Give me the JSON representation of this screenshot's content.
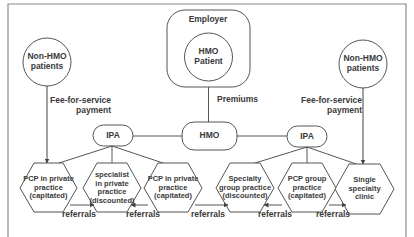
{
  "nodes": {
    "employer": {
      "label": "Employer"
    },
    "hmo_patient": {
      "label": "HMO\nPatient"
    },
    "non_hmo_left": {
      "label": "Non-HMO\npatients"
    },
    "non_hmo_right": {
      "label": "Non-HMO\npatients"
    },
    "ipa_left": {
      "label": "IPA"
    },
    "hmo": {
      "label": "HMO"
    },
    "ipa_right": {
      "label": "IPA"
    },
    "hex": [
      {
        "label": "PCP in private\npractice\n(capitated)"
      },
      {
        "label": "specialist\nin private\npractice\n(discounted)"
      },
      {
        "label": "PCP in private\npractice\n(capitated)"
      },
      {
        "label": "Specialty\ngroup practice\n(discounted)"
      },
      {
        "label": "PCP group\npractice\n(capitated)"
      },
      {
        "label": "Single\nspecialty\nclinic"
      }
    ]
  },
  "edge_labels": {
    "fee_left": "Fee-for-service\npayment",
    "fee_right": "Fee-for-service\npayment",
    "premiums": "Premiums",
    "referrals": [
      "referrals",
      "referrals",
      "referrals",
      "referrals",
      "referrals"
    ]
  },
  "colors": {
    "stroke": "#555555",
    "text": "#3a3a3a",
    "frame": "#888888",
    "background": "#ffffff"
  }
}
